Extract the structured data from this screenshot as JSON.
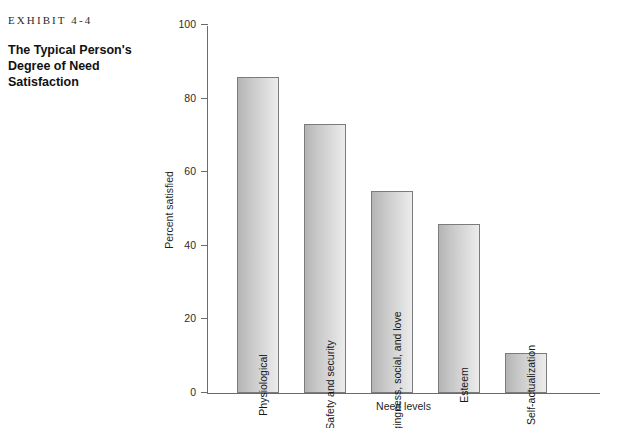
{
  "caption": {
    "exhibit_label": "EXHIBIT 4-4",
    "title_line1": "The Typical Person's",
    "title_line2": "Degree of Need Satisfaction"
  },
  "chart_data": {
    "type": "bar",
    "title": "The Typical Person's Degree of Need Satisfaction",
    "xlabel": "Need levels",
    "ylabel": "Percent satisfied",
    "ylim": [
      0,
      100
    ],
    "yticks": [
      0,
      20,
      40,
      60,
      80,
      100
    ],
    "grid": false,
    "legend": null,
    "categories": [
      "Physiological",
      "Safety and security",
      "Belongingness, social, and love",
      "Esteem",
      "Self-actualization"
    ],
    "values": [
      86,
      73,
      55,
      46,
      11
    ],
    "bar_color_left": "#b4b4b4",
    "bar_color_right": "#ececec",
    "bar_border_color": "#7b7b7b",
    "axis_color": "#6b6b6b"
  }
}
